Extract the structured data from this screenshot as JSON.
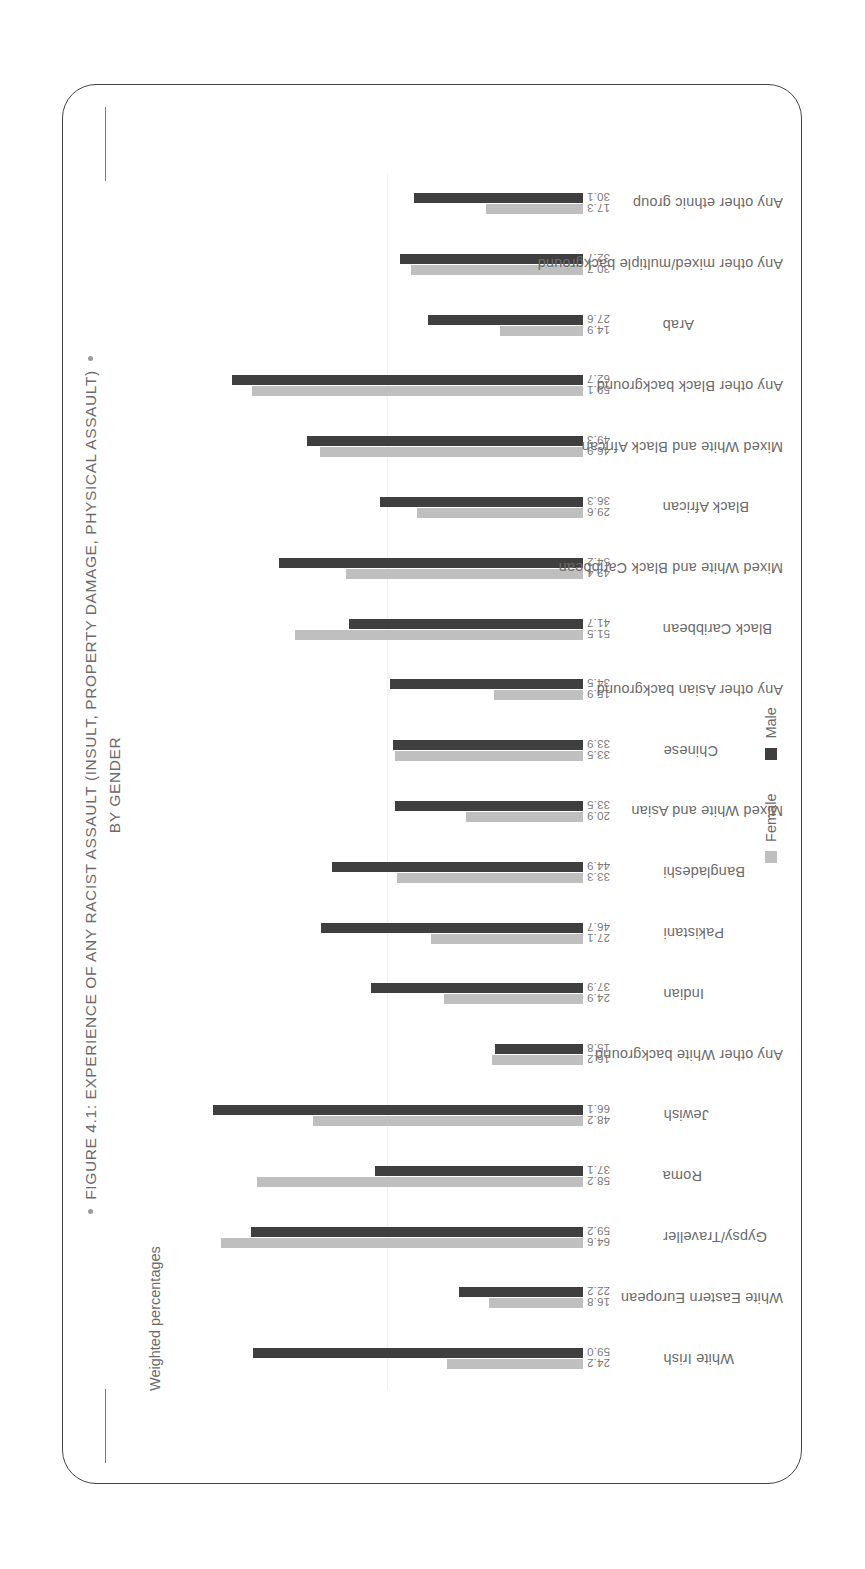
{
  "figure": {
    "title_line1": "FIGURE 4.1: EXPERIENCE OF ANY RACIST ASSAULT (INSULT, PROPERTY DAMAGE, PHYSICAL ASSAULT)",
    "title_line2": "BY GENDER",
    "subnote": "Weighted percentages"
  },
  "legend": {
    "female_label": "Female",
    "male_label": "Male",
    "female_color": "#bfbfbf",
    "male_color": "#3f3f3f"
  },
  "chart_data": {
    "type": "bar",
    "title": "FIGURE 4.1: EXPERIENCE OF ANY RACIST ASSAULT (INSULT, PROPERTY DAMAGE, PHYSICAL ASSAULT) BY GENDER",
    "subtitle": "Weighted percentages",
    "xlabel": "",
    "ylabel": "Weighted percentages",
    "ylim": [
      0,
      70
    ],
    "grid": false,
    "legend_position": "bottom",
    "categories": [
      "White Irish",
      "White Eastern European",
      "Gypsy/Traveller",
      "Roma",
      "Jewish",
      "Any other White background",
      "Indian",
      "Pakistani",
      "Bangladeshi",
      "Mixed White and Asian",
      "Chinese",
      "Any other Asian background",
      "Black Caribbean",
      "Mixed White and Black Caribbean",
      "Black African",
      "Mixed White and Black African",
      "Any other Black background",
      "Arab",
      "Any other mixed/multiple background",
      "Any other ethnic group"
    ],
    "series": [
      {
        "name": "Female",
        "color": "#bfbfbf",
        "values": [
          24.2,
          16.8,
          64.6,
          58.2,
          48.2,
          16.2,
          24.9,
          27.1,
          33.3,
          20.9,
          33.5,
          15.9,
          51.5,
          42.4,
          29.6,
          46.9,
          59.1,
          14.9,
          30.7,
          17.3
        ]
      },
      {
        "name": "Male",
        "color": "#3f3f3f",
        "values": [
          59.0,
          22.2,
          59.2,
          37.1,
          66.1,
          15.8,
          37.9,
          46.7,
          44.9,
          33.5,
          33.9,
          34.5,
          41.7,
          54.2,
          36.3,
          49.3,
          62.7,
          27.6,
          32.7,
          30.1
        ]
      }
    ],
    "data_labels": [
      [
        "24.2",
        "59.0"
      ],
      [
        "16.8",
        "22.2"
      ],
      [
        "64.6",
        "59.2"
      ],
      [
        "58.2",
        "37.1"
      ],
      [
        "48.2",
        "66.1"
      ],
      [
        "16.2",
        "15.8"
      ],
      [
        "24.9",
        "37.9"
      ],
      [
        "27.1",
        "46.7"
      ],
      [
        "33.3",
        "44.9"
      ],
      [
        "20.9",
        "33.5"
      ],
      [
        "33.5",
        "33.9"
      ],
      [
        "15.9",
        "34.5"
      ],
      [
        "51.5",
        "41.7"
      ],
      [
        "42.4",
        "54.2"
      ],
      [
        "29.6",
        "36.3"
      ],
      [
        "46.9",
        "49.3"
      ],
      [
        "59.1",
        "62.7"
      ],
      [
        "14.9",
        "27.6"
      ],
      [
        "30.7",
        "32.7"
      ],
      [
        "17.3",
        "30.1"
      ]
    ]
  }
}
